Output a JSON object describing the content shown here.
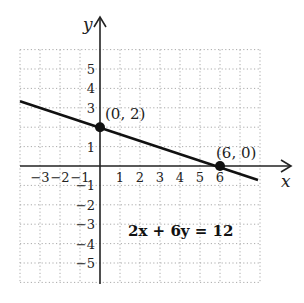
{
  "figure": {
    "equation": "2x + 6y = 12",
    "x_axis_label": "x",
    "y_axis_label": "y",
    "x_tick_labels": [
      "−3",
      "−2",
      "−1",
      "1",
      "2",
      "3",
      "4",
      "5",
      "6"
    ],
    "x_tick_values": [
      -3,
      -2,
      -1,
      1,
      2,
      3,
      4,
      5,
      6
    ],
    "y_tick_labels": [
      "5",
      "4",
      "3",
      "1",
      "−1",
      "−2",
      "−3",
      "−4",
      "−5"
    ],
    "y_tick_values": [
      5,
      4,
      3,
      1,
      -1,
      -2,
      -3,
      -4,
      -5
    ],
    "points": [
      {
        "label": "(0, 2)",
        "x": 0,
        "y": 2
      },
      {
        "label": "(6, 0)",
        "x": 6,
        "y": 0
      }
    ],
    "grid": {
      "x_min": -4,
      "x_max": 8,
      "y_min": -6,
      "y_max": 6,
      "style": "dotted"
    },
    "line": {
      "x_start": -4,
      "x_end": 8,
      "color": "#111111"
    },
    "colors": {
      "axis": "#222222",
      "grid": "#aaaaaa",
      "line": "#111111",
      "point": "#111111"
    }
  }
}
